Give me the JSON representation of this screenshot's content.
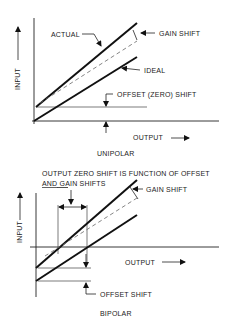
{
  "unipolar": {
    "title": "UNIPOLAR",
    "y_axis_label": "INPUT",
    "x_axis_label": "OUTPUT",
    "labels": {
      "actual": "ACTUAL",
      "gain_shift": "GAIN SHIFT",
      "ideal": "IDEAL",
      "offset_shift": "OFFSET (ZERO) SHIFT"
    }
  },
  "bipolar": {
    "title": "BIPOLAR",
    "y_axis_label": "INPUT",
    "x_axis_label": "OUTPUT",
    "labels": {
      "note_line1": "OUTPUT ZERO SHIFT IS FUNCTION OF OFFSET",
      "note_line2_underlined": "AND",
      "note_line2_rest": " GAIN SHIFTS",
      "gain_shift": "GAIN SHIFT",
      "offset_shift": "OFFSET SHIFT"
    }
  }
}
